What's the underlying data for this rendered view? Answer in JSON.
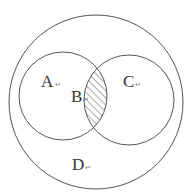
{
  "diagram": {
    "type": "venn",
    "regions": [
      {
        "id": "A",
        "label": "A",
        "mark": "↵"
      },
      {
        "id": "B",
        "label": "B",
        "mark": "↵"
      },
      {
        "id": "C",
        "label": "C",
        "mark": "↵"
      },
      {
        "id": "D",
        "label": "D",
        "mark": "↵"
      }
    ],
    "shaded_region": "B",
    "colors": {
      "stroke": "#555555",
      "hatch": "#555555",
      "text": "#333333",
      "background": "#ffffff"
    }
  }
}
